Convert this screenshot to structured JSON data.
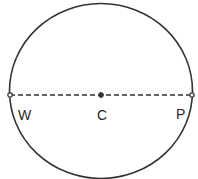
{
  "diagram": {
    "circle": {
      "cx": 101,
      "cy": 91,
      "rx": 91.5,
      "ry": 87.5,
      "stroke": "#333333"
    },
    "diameter": {
      "x1": 10,
      "y1": 95,
      "x2": 192,
      "y2": 95,
      "style": "dashed"
    },
    "points": [
      {
        "id": "W",
        "label": "W",
        "x": 10,
        "y": 95,
        "marker": "open"
      },
      {
        "id": "C",
        "label": "C",
        "x": 101,
        "y": 95,
        "marker": "filled"
      },
      {
        "id": "P",
        "label": "P",
        "x": 192,
        "y": 95,
        "marker": "open"
      }
    ],
    "labels": {
      "W": "W",
      "C": "C",
      "P": "P"
    }
  }
}
